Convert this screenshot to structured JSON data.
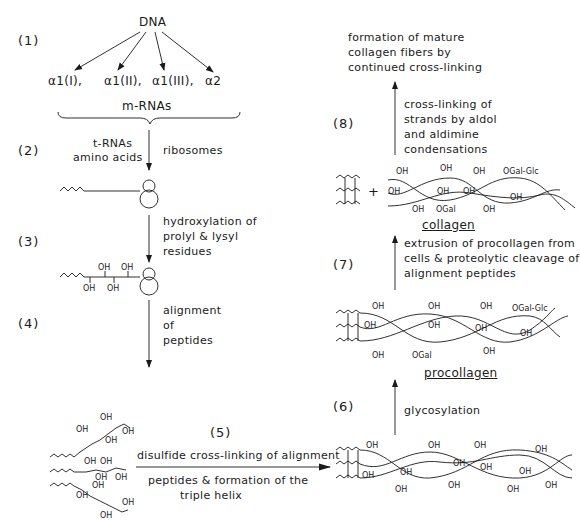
{
  "steps": {
    "s1": "(1)",
    "s2": "(2)",
    "s3": "(3)",
    "s4": "(4)",
    "s5": "(5)",
    "s6": "(6)",
    "s7": "(7)",
    "s8": "(8)"
  },
  "dna": "DNA",
  "mrna_chains": [
    "α1(I),",
    "α1(II),",
    "α1(III),",
    "α2"
  ],
  "mrnas_label": "m-RNAs",
  "step2": {
    "left": [
      "t-RNAs",
      "amino acids"
    ],
    "right": "ribosomes"
  },
  "step3": [
    "hydroxylation of",
    "prolyl & lysyl",
    "residues"
  ],
  "step4": [
    "alignment",
    "of",
    "peptides"
  ],
  "step5": {
    "above": "disulfide cross-linking of alignment",
    "below": [
      "peptides & formation of the",
      "triple helix"
    ]
  },
  "step6": "glycosylation",
  "procollagen_label": "procollagen",
  "step7": [
    "extrusion of procollagen from",
    "cells & proteolytic cleavage of",
    "alignment peptides"
  ],
  "collagen_label": "collagen",
  "step8": [
    "cross-linking of",
    "strands by aldol",
    "and aldimine",
    "condensations"
  ],
  "final": [
    "formation of mature",
    "collagen fibers by",
    "continued cross-linking"
  ],
  "groups": {
    "oh": "OH",
    "ogal": "OGal",
    "ogalglc": "OGal-Glc",
    "plus": "+"
  }
}
